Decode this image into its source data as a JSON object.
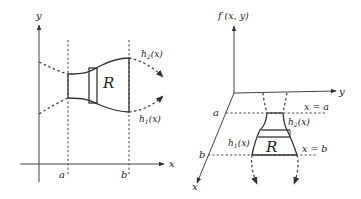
{
  "left_diagram": {
    "axis_y_label": "y",
    "axis_x_label": "x",
    "tick_a": "a",
    "tick_b": "b",
    "upper_curve_label": "h",
    "upper_curve_sub": "2",
    "upper_curve_arg": "(x)",
    "lower_curve_label": "h",
    "lower_curve_sub": "1",
    "lower_curve_arg": "(x)",
    "region_label": "R"
  },
  "right_diagram": {
    "vertical_axis_label": "f (x, y)",
    "axis_y_label": "y",
    "axis_x_label": "x",
    "tick_a": "a",
    "tick_b": "b",
    "line_a_label": "x = a",
    "line_b_label": "x = b",
    "upper_curve_label": "h",
    "upper_curve_sub": "2",
    "upper_curve_arg": "(x)",
    "lower_curve_label": "h",
    "lower_curve_sub": "1",
    "lower_curve_arg": "(x)",
    "region_label": "R"
  }
}
